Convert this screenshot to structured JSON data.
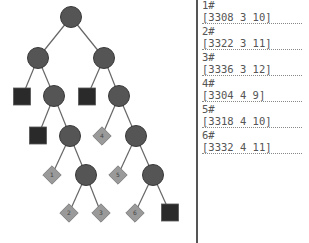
{
  "tree": {
    "colors": {
      "circle": "#555555",
      "square": "#2a2a2a",
      "diamond": "#9a9a9a",
      "edge": "#666666"
    },
    "nodes": [
      {
        "id": "n0",
        "type": "circle",
        "x": 71,
        "y": 17
      },
      {
        "id": "n1",
        "type": "circle",
        "x": 38,
        "y": 58
      },
      {
        "id": "n2",
        "type": "circle",
        "x": 104,
        "y": 58
      },
      {
        "id": "n3",
        "type": "square",
        "x": 22,
        "y": 97
      },
      {
        "id": "n4",
        "type": "circle",
        "x": 54,
        "y": 96
      },
      {
        "id": "n5",
        "type": "square",
        "x": 87,
        "y": 97
      },
      {
        "id": "n6",
        "type": "circle",
        "x": 119,
        "y": 96
      },
      {
        "id": "n7",
        "type": "square",
        "x": 38,
        "y": 136
      },
      {
        "id": "n8",
        "type": "circle",
        "x": 70,
        "y": 136
      },
      {
        "id": "n9",
        "type": "diamond",
        "x": 102,
        "y": 136,
        "label": "4"
      },
      {
        "id": "n10",
        "type": "circle",
        "x": 136,
        "y": 136
      },
      {
        "id": "n11",
        "type": "diamond",
        "x": 52,
        "y": 175,
        "label": "1"
      },
      {
        "id": "n12",
        "type": "circle",
        "x": 86,
        "y": 175
      },
      {
        "id": "n13",
        "type": "diamond",
        "x": 118,
        "y": 175,
        "label": "5"
      },
      {
        "id": "n14",
        "type": "circle",
        "x": 153,
        "y": 175
      },
      {
        "id": "n15",
        "type": "diamond",
        "x": 69,
        "y": 213,
        "label": "2"
      },
      {
        "id": "n16",
        "type": "diamond",
        "x": 101,
        "y": 213,
        "label": "3"
      },
      {
        "id": "n17",
        "type": "diamond",
        "x": 135,
        "y": 213,
        "label": "6"
      },
      {
        "id": "n18",
        "type": "square",
        "x": 170,
        "y": 213
      }
    ],
    "edges": [
      [
        "n0",
        "n1"
      ],
      [
        "n0",
        "n2"
      ],
      [
        "n1",
        "n3"
      ],
      [
        "n1",
        "n4"
      ],
      [
        "n2",
        "n5"
      ],
      [
        "n2",
        "n6"
      ],
      [
        "n4",
        "n7"
      ],
      [
        "n4",
        "n8"
      ],
      [
        "n6",
        "n9"
      ],
      [
        "n6",
        "n10"
      ],
      [
        "n8",
        "n11"
      ],
      [
        "n8",
        "n12"
      ],
      [
        "n10",
        "n13"
      ],
      [
        "n10",
        "n14"
      ],
      [
        "n12",
        "n15"
      ],
      [
        "n12",
        "n16"
      ],
      [
        "n14",
        "n17"
      ],
      [
        "n14",
        "n18"
      ]
    ]
  },
  "panel": {
    "entries": [
      {
        "id": "1#",
        "value": "[3308 3 10]"
      },
      {
        "id": "2#",
        "value": "[3322 3 11]"
      },
      {
        "id": "3#",
        "value": "[3336 3 12]"
      },
      {
        "id": "4#",
        "value": "[3304 4 9]"
      },
      {
        "id": "5#",
        "value": "[3318 4 10]"
      },
      {
        "id": "6#",
        "value": "[3332 4 11]"
      }
    ]
  }
}
